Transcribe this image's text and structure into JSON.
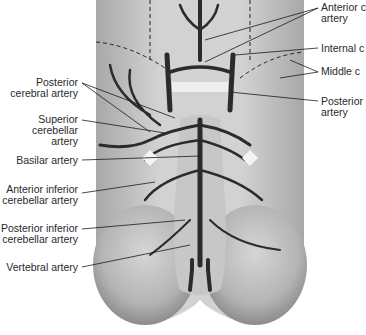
{
  "figure": {
    "colors": {
      "background": "#ffffff",
      "brain_light": "#d9d9d9",
      "brain_mid": "#bdbdbd",
      "brain_dark": "#8f8f8f",
      "artery": "#2b2b2b",
      "leader": "#1a1a1a",
      "text": "#2a2a2a"
    }
  },
  "labels_left": [
    {
      "line1": "Posterior",
      "line2": "cerebral artery"
    },
    {
      "line1": "Superior",
      "line2": "cerebellar",
      "line3": "artery"
    },
    {
      "line1": "Basilar artery"
    },
    {
      "line1": "Anterior inferior",
      "line2": "cerebellar artery"
    },
    {
      "line1": "Posterior inferior",
      "line2": "cerebellar artery"
    },
    {
      "line1": "Vertebral artery"
    }
  ],
  "labels_right": [
    {
      "line1": "Anterior c",
      "line2": "artery"
    },
    {
      "line1": "Internal c"
    },
    {
      "line1": "Middle c"
    },
    {
      "line1": "Posterior",
      "line2": "artery"
    }
  ]
}
